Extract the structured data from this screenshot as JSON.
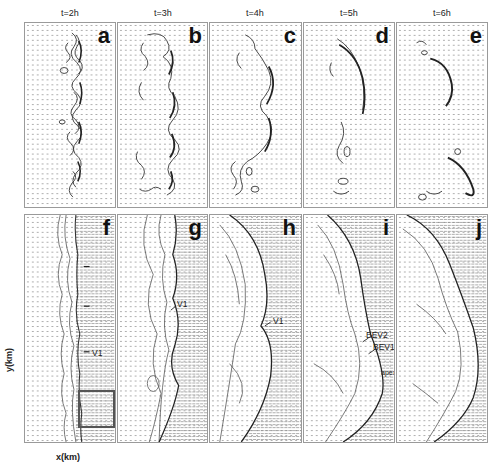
{
  "figure": {
    "top_row": {
      "panels": [
        {
          "letter": "a",
          "time": "t=2h"
        },
        {
          "letter": "b",
          "time": "t=3h"
        },
        {
          "letter": "c",
          "time": "t=4h"
        },
        {
          "letter": "d",
          "time": "t=5h"
        },
        {
          "letter": "e",
          "time": "t=6h"
        }
      ]
    },
    "bottom_row": {
      "panels": [
        {
          "letter": "f"
        },
        {
          "letter": "g"
        },
        {
          "letter": "h"
        },
        {
          "letter": "i"
        },
        {
          "letter": "j"
        }
      ]
    },
    "annotations": {
      "f_v1": "V1",
      "g_v1": "V1",
      "h_v1": "V1",
      "i_bev2": "BEV2",
      "i_bev1": "BEV1",
      "i_apex": "apex"
    },
    "axes": {
      "ylabel": "y(km)",
      "xlabel": "x(km)"
    },
    "colors": {
      "frame": "#9a9a9a",
      "contour": "#333333",
      "vector": "#8a8a8a",
      "inset": "#555555"
    }
  }
}
